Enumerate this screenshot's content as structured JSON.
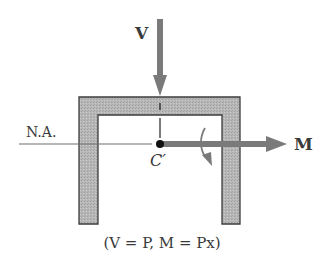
{
  "labels": {
    "shear_force": "V",
    "moment": "M",
    "neutral_axis": "N.A.",
    "shear_center": "C′",
    "caption": "(V = P, M = Px)"
  },
  "colors": {
    "arrow": "#7a7a7a",
    "frame_fill": "#b4b4b4",
    "frame_stroke": "#3c3c3c",
    "line": "#6e6e6e",
    "text": "#3a3a3a",
    "dot": "#111111"
  }
}
